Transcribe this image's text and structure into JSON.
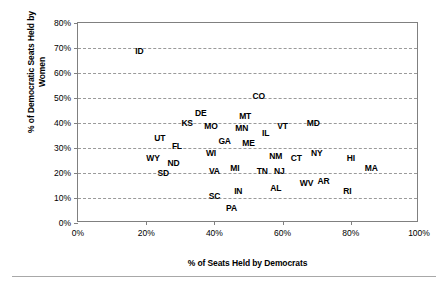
{
  "chart_data": {
    "type": "scatter",
    "title": "",
    "xlabel": "% of Seats Held by Democrats",
    "ylabel": "% of Democratic Seats Held by Women",
    "ylabel_line1": "% of Democratic Seats Held by",
    "ylabel_line2": "Women",
    "xlim": [
      0,
      100
    ],
    "ylim": [
      0,
      80
    ],
    "xticks": [
      0,
      20,
      40,
      60,
      80,
      100
    ],
    "yticks": [
      0,
      10,
      20,
      30,
      40,
      50,
      60,
      70,
      80
    ],
    "xtick_labels": [
      "0%",
      "20%",
      "40%",
      "60%",
      "80%",
      "100%"
    ],
    "ytick_labels": [
      "0%",
      "10%",
      "20%",
      "30%",
      "40%",
      "50%",
      "60%",
      "70%",
      "80%"
    ],
    "grid": "horizontal-dashed",
    "legend": "none",
    "marker_style": "text-label",
    "points": [
      {
        "label": "ID",
        "x": 18,
        "y": 69
      },
      {
        "label": "CO",
        "x": 53,
        "y": 51
      },
      {
        "label": "DE",
        "x": 36,
        "y": 44
      },
      {
        "label": "MT",
        "x": 49,
        "y": 43
      },
      {
        "label": "KS",
        "x": 32,
        "y": 40
      },
      {
        "label": "MD",
        "x": 69,
        "y": 40
      },
      {
        "label": "MO",
        "x": 39,
        "y": 39
      },
      {
        "label": "MN",
        "x": 48,
        "y": 38
      },
      {
        "label": "VT",
        "x": 60,
        "y": 39
      },
      {
        "label": "IL",
        "x": 55,
        "y": 36
      },
      {
        "label": "UT",
        "x": 24,
        "y": 34
      },
      {
        "label": "GA",
        "x": 43,
        "y": 33
      },
      {
        "label": "ME",
        "x": 50,
        "y": 32
      },
      {
        "label": "FL",
        "x": 29,
        "y": 31
      },
      {
        "label": "WI",
        "x": 39,
        "y": 28
      },
      {
        "label": "NY",
        "x": 70,
        "y": 28
      },
      {
        "label": "HI",
        "x": 80,
        "y": 26
      },
      {
        "label": "WY",
        "x": 22,
        "y": 26
      },
      {
        "label": "NM",
        "x": 58,
        "y": 27
      },
      {
        "label": "CT",
        "x": 64,
        "y": 26
      },
      {
        "label": "ND",
        "x": 28,
        "y": 24
      },
      {
        "label": "MI",
        "x": 46,
        "y": 22
      },
      {
        "label": "TN",
        "x": 54,
        "y": 21
      },
      {
        "label": "NJ",
        "x": 59,
        "y": 21
      },
      {
        "label": "MA",
        "x": 86,
        "y": 22
      },
      {
        "label": "VA",
        "x": 40,
        "y": 21
      },
      {
        "label": "SD",
        "x": 25,
        "y": 20
      },
      {
        "label": "AR",
        "x": 72,
        "y": 17
      },
      {
        "label": "WV",
        "x": 67,
        "y": 16
      },
      {
        "label": "AL",
        "x": 58,
        "y": 14
      },
      {
        "label": "RI",
        "x": 79,
        "y": 13
      },
      {
        "label": "IN",
        "x": 47,
        "y": 13
      },
      {
        "label": "SC",
        "x": 40,
        "y": 11
      },
      {
        "label": "PA",
        "x": 45,
        "y": 6
      }
    ]
  },
  "colors": {
    "axis": "#808080",
    "grid": "#9a9a9a",
    "text": "#000000",
    "background": "#ffffff",
    "rule": "#a8a8a8"
  }
}
